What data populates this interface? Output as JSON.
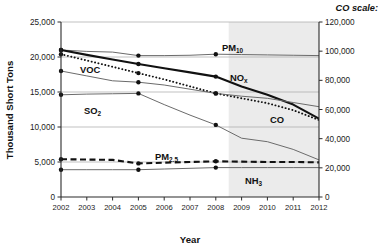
{
  "axes": {
    "ylabel_left": "Thousand Short Tons",
    "xlabel": "Year",
    "right_scale_header": "CO scale:",
    "yticks_left": [
      "25,000",
      "20,000",
      "15,000",
      "10,000",
      "5,000",
      "0"
    ],
    "yticks_right": [
      "120,000",
      "100,000",
      "80,000",
      "60,000",
      "40,000",
      "20,000",
      "0"
    ],
    "xticks": [
      "2002",
      "2003",
      "2004",
      "2005",
      "2006",
      "2007",
      "2008",
      "2009",
      "2010",
      "2011",
      "2012"
    ]
  },
  "series_labels": {
    "pm10": "PM",
    "pm10_sub": "10",
    "nox": "NO",
    "nox_sub": "x",
    "voc": "VOC",
    "so2": "SO",
    "so2_sub": "2",
    "co": "CO",
    "pm25": "PM",
    "pm25_sub": "2.5",
    "nh3": "NH",
    "nh3_sub": "3"
  },
  "colors": {
    "axis": "#2b2b2b",
    "gridline": "#a8a8a8",
    "thin_series": "#6b6b6b",
    "bold_series": "#111111",
    "marker": "#111111",
    "shaded_region": "#ebebeb",
    "text": "#1a1a1a"
  },
  "chart_data": {
    "type": "line",
    "title": "",
    "xlabel": "Year",
    "ylabel": "Thousand Short Tons",
    "y2label": "CO scale:",
    "xlim": [
      2002,
      2012
    ],
    "ylim": [
      0,
      25000
    ],
    "y2lim": [
      0,
      120000
    ],
    "grid": true,
    "legend": "inline-annotations",
    "x": [
      2002,
      2003,
      2004,
      2005,
      2006,
      2007,
      2008,
      2009,
      2010,
      2011,
      2012
    ],
    "shaded_region": {
      "from": 2008.5,
      "to": 2012,
      "note": "projected/estimated years shaded light gray"
    },
    "marker_years": [
      2002,
      2005,
      2008
    ],
    "series": [
      {
        "name": "PM10",
        "axis": "left",
        "style": "thin-solid",
        "values": [
          21000,
          20800,
          20700,
          20200,
          20200,
          20250,
          20400,
          20350,
          20300,
          20250,
          20200
        ]
      },
      {
        "name": "NOx",
        "axis": "left",
        "style": "bold-solid",
        "values": [
          21000,
          20300,
          19650,
          19000,
          18400,
          17800,
          17200,
          15800,
          14600,
          13200,
          11200
        ]
      },
      {
        "name": "CO",
        "axis": "right",
        "style": "dotted",
        "values_left_equivalent": [
          20400,
          19500,
          18600,
          17700,
          16800,
          15800,
          14800,
          14100,
          13400,
          12400,
          11000
        ],
        "values": [
          98000,
          93600,
          89300,
          85000,
          80600,
          75800,
          71000,
          67700,
          64300,
          59500,
          52800
        ]
      },
      {
        "name": "VOC",
        "axis": "left",
        "style": "thin-solid",
        "values": [
          18000,
          17300,
          16600,
          16400,
          16000,
          15400,
          14800,
          14400,
          14100,
          13500,
          12900
        ]
      },
      {
        "name": "SO2",
        "axis": "left",
        "style": "thin-solid",
        "values": [
          14600,
          14700,
          14750,
          14800,
          13200,
          11700,
          10300,
          8400,
          7900,
          6800,
          5300
        ]
      },
      {
        "name": "PM2.5",
        "axis": "left",
        "style": "bold-dashed",
        "values": [
          5400,
          5350,
          5300,
          4800,
          4900,
          5000,
          5100,
          5050,
          5000,
          5000,
          4950
        ]
      },
      {
        "name": "NH3",
        "axis": "left",
        "style": "thin-solid",
        "values": [
          3900,
          3900,
          3900,
          3900,
          4000,
          4100,
          4200,
          4200,
          4200,
          4200,
          4200
        ]
      }
    ]
  }
}
